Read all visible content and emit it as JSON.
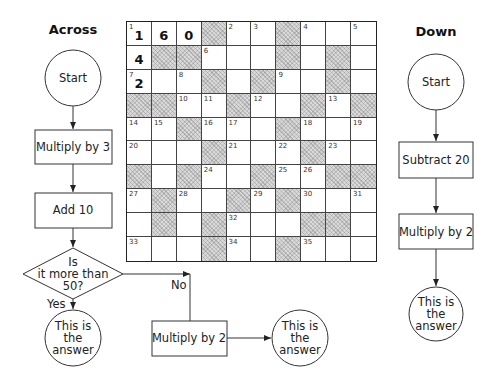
{
  "across": {
    "title": "Across",
    "start": "Start",
    "step1": "Multiply by 3",
    "step2": "Add 10",
    "decision_line1": "Is",
    "decision_line2": "it more than",
    "decision_line3": "50?",
    "yes_label": "Yes",
    "no_label": "No",
    "yes_answer_line1": "This is",
    "yes_answer_line2": "the",
    "yes_answer_line3": "answer",
    "no_step": "Multiply by 2",
    "no_answer_line1": "This is",
    "no_answer_line2": "the",
    "no_answer_line3": "answer"
  },
  "down": {
    "title": "Down",
    "start": "Start",
    "step1": "Subtract 20",
    "step2": "Multiply by 2",
    "answer_line1": "This is",
    "answer_line2": "the",
    "answer_line3": "answer"
  },
  "grid": {
    "rows": 10,
    "cols": 10,
    "cells": [
      [
        {
          "n": "1",
          "a": "1"
        },
        {
          "a": "6"
        },
        {
          "a": "0"
        },
        {
          "s": true
        },
        {
          "n": "2"
        },
        {
          "n": "3"
        },
        {
          "s": true
        },
        {
          "n": "4"
        },
        {},
        {
          "n": "5"
        }
      ],
      [
        {
          "a": "4"
        },
        {
          "s": true
        },
        {
          "s": true
        },
        {
          "n": "6"
        },
        {},
        {},
        {
          "s": true
        },
        {},
        {
          "s": true
        },
        {}
      ],
      [
        {
          "n": "7",
          "a": "2"
        },
        {},
        {
          "n": "8"
        },
        {
          "s": true
        },
        {},
        {
          "s": true
        },
        {
          "n": "9"
        },
        {},
        {
          "s": true
        },
        {}
      ],
      [
        {
          "s": true
        },
        {
          "s": true
        },
        {
          "n": "10"
        },
        {
          "n": "11"
        },
        {
          "s": true
        },
        {
          "n": "12"
        },
        {},
        {
          "s": true
        },
        {
          "n": "13"
        },
        {
          "s": true
        }
      ],
      [
        {
          "n": "14"
        },
        {
          "n": "15"
        },
        {
          "s": true
        },
        {
          "n": "16"
        },
        {
          "n": "17"
        },
        {},
        {
          "s": true
        },
        {
          "n": "18"
        },
        {},
        {
          "n": "19"
        }
      ],
      [
        {
          "n": "20"
        },
        {},
        {},
        {
          "s": true
        },
        {
          "n": "21"
        },
        {},
        {
          "n": "22"
        },
        {
          "s": true
        },
        {
          "n": "23"
        },
        {}
      ],
      [
        {
          "s": true
        },
        {},
        {
          "s": true
        },
        {
          "n": "24"
        },
        {},
        {
          "s": true
        },
        {
          "n": "25"
        },
        {
          "n": "26"
        },
        {
          "s": true
        },
        {
          "s": true
        }
      ],
      [
        {
          "n": "27"
        },
        {
          "s": true
        },
        {
          "n": "28"
        },
        {},
        {
          "s": true
        },
        {
          "n": "29"
        },
        {
          "s": true
        },
        {
          "n": "30"
        },
        {},
        {
          "n": "31"
        }
      ],
      [
        {},
        {
          "s": true
        },
        {},
        {
          "s": true
        },
        {
          "n": "32"
        },
        {},
        {},
        {
          "s": true
        },
        {
          "s": true
        },
        {}
      ],
      [
        {
          "n": "33"
        },
        {},
        {},
        {
          "s": true
        },
        {
          "n": "34"
        },
        {},
        {
          "s": true
        },
        {
          "n": "35"
        },
        {},
        {}
      ]
    ]
  }
}
